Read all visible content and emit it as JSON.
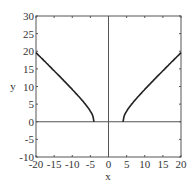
{
  "chart_data": {
    "type": "line",
    "title": "",
    "xlabel": "x",
    "ylabel": "y",
    "xlim": [
      -20,
      20
    ],
    "ylim": [
      -10,
      30
    ],
    "xticks": [
      -20,
      -15,
      -10,
      -5,
      0,
      5,
      10,
      15,
      20
    ],
    "yticks": [
      -10,
      -5,
      0,
      5,
      10,
      15,
      20,
      25,
      30
    ],
    "grid": false,
    "legend": null,
    "series": [
      {
        "name": "left branch",
        "x": [
          -20,
          -18,
          -16,
          -14,
          -12,
          -10,
          -8,
          -6,
          -5,
          -4.5,
          -4
        ],
        "y": [
          19.6,
          17.5,
          15.5,
          13.4,
          11.3,
          9.2,
          6.9,
          4.5,
          3.0,
          2.1,
          0
        ]
      },
      {
        "name": "right branch",
        "x": [
          4,
          4.5,
          5,
          6,
          8,
          10,
          12,
          14,
          16,
          18,
          20
        ],
        "y": [
          0,
          2.1,
          3.0,
          4.5,
          6.9,
          9.2,
          11.3,
          13.4,
          15.5,
          17.5,
          19.6
        ]
      }
    ],
    "reference_lines": [
      {
        "orientation": "horizontal",
        "value": 0
      },
      {
        "orientation": "vertical",
        "value": 0
      }
    ]
  },
  "axes": {
    "xlabel": "x",
    "ylabel": "y",
    "xtick_labels": [
      "-20",
      "-15",
      "-10",
      "-5",
      "0",
      "5",
      "10",
      "15",
      "20"
    ],
    "ytick_labels": [
      "-10",
      "-5",
      "0",
      "5",
      "10",
      "15",
      "20",
      "25",
      "30"
    ]
  }
}
